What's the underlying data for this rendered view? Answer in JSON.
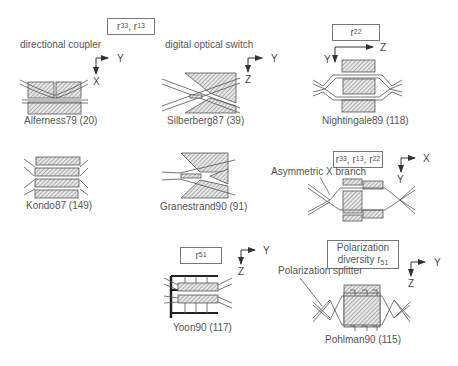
{
  "coefficient_boxes": {
    "r33_r13": {
      "base": "r",
      "parts": [
        {
          "sub": "33"
        },
        {
          "sub": "13"
        }
      ]
    },
    "r22": {
      "base": "r",
      "sub": "22"
    },
    "r33_r13_r22": {
      "base": "r",
      "parts": [
        {
          "sub": "33"
        },
        {
          "sub": "13"
        },
        {
          "sub": "22"
        }
      ]
    },
    "r51": {
      "base": "r",
      "sub": "51"
    },
    "polarization_diversity": {
      "line1": "Polarization",
      "line2": "diversity r",
      "sub": "51"
    }
  },
  "section_labels": {
    "directional_coupler": "directional coupler",
    "digital_optical_switch": "digital optical switch",
    "asymmetric_x_branch": "Asymmetric X branch",
    "polarization_splitter": "Polarization splitter"
  },
  "devices": [
    {
      "id": "alferness",
      "caption": "Alferness79 (20)",
      "axes": [
        "Y",
        "X"
      ]
    },
    {
      "id": "silberberg",
      "caption": "Silberberg87 (39)",
      "axes": [
        "Y",
        "Z"
      ]
    },
    {
      "id": "nightingale",
      "caption": "Nightingale89 (118)",
      "axes": [
        "Z",
        "Y"
      ]
    },
    {
      "id": "kondo",
      "caption": "Kondo87 (149)"
    },
    {
      "id": "granestrand",
      "caption": "Granestrand90 (91)"
    },
    {
      "id": "asym-x",
      "caption": "",
      "axes": [
        "X",
        "Y"
      ]
    },
    {
      "id": "yoon",
      "caption": "Yoon90 (117)",
      "axes": [
        "Y",
        "Z"
      ]
    },
    {
      "id": "pohlman",
      "caption": "Pohlman90 (115)",
      "axes": [
        "Y",
        "Z"
      ]
    }
  ],
  "colors": {
    "line": "#555555",
    "hatch": "#8a8a8a",
    "text": "#555555"
  }
}
